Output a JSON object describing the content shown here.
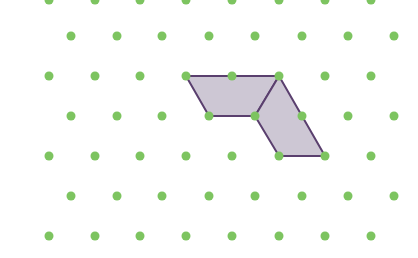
{
  "diagram": {
    "type": "isometric dot grid with shaded shape",
    "background": "#ffffff",
    "dot_color": "#7dc460",
    "dot_radius": 4.5,
    "rows": [
      {
        "y": 0,
        "xs": [
          49,
          95,
          140,
          186,
          232,
          279,
          325,
          371
        ]
      },
      {
        "y": 36,
        "xs": [
          71,
          117,
          162,
          209,
          255,
          302,
          348,
          394
        ]
      },
      {
        "y": 76,
        "xs": [
          49,
          95,
          140,
          186,
          232,
          279,
          325,
          371
        ]
      },
      {
        "y": 116,
        "xs": [
          71,
          117,
          162,
          209,
          255,
          302,
          348,
          394
        ]
      },
      {
        "y": 156,
        "xs": [
          49,
          95,
          140,
          186,
          232,
          279,
          325,
          371
        ]
      },
      {
        "y": 196,
        "xs": [
          71,
          117,
          162,
          209,
          255,
          302,
          348,
          394
        ]
      },
      {
        "y": 236,
        "xs": [
          49,
          95,
          140,
          186,
          232,
          279,
          325,
          371
        ]
      }
    ],
    "shapes": [
      {
        "name": "upper-parallelogram",
        "points": [
          [
            186,
            76
          ],
          [
            279,
            76
          ],
          [
            255,
            116
          ],
          [
            209,
            116
          ]
        ]
      },
      {
        "name": "lower-parallelogram",
        "points": [
          [
            279,
            76
          ],
          [
            325,
            156
          ],
          [
            279,
            156
          ],
          [
            255,
            116
          ]
        ]
      }
    ],
    "shape_fill": "#cdc7d4",
    "shape_stroke": "#5a3f6e",
    "shape_stroke_width": 2
  }
}
